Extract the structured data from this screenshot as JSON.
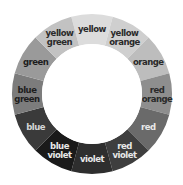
{
  "diagram": {
    "title": "",
    "type": "color-wheel",
    "center": [
      92,
      94
    ],
    "outer_radius": 80,
    "inner_radius": 50,
    "segments": [
      {
        "name": "yellow",
        "lines": [
          "yellow"
        ],
        "fill": "#dcdcdc",
        "text_color": "#2a2a2a"
      },
      {
        "name": "yellow orange",
        "lines": [
          "yellow",
          "orange"
        ],
        "fill": "#cfcfcf",
        "text_color": "#2a2a2a"
      },
      {
        "name": "orange",
        "lines": [
          "orange"
        ],
        "fill": "#bdbdbd",
        "text_color": "#2a2a2a"
      },
      {
        "name": "red orange",
        "lines": [
          "red",
          "orange"
        ],
        "fill": "#8e8e8e",
        "text_color": "#2a2a2a"
      },
      {
        "name": "red",
        "lines": [
          "red"
        ],
        "fill": "#6a6a6a",
        "text_color": "#e8e8e8"
      },
      {
        "name": "red violet",
        "lines": [
          "red",
          "violet"
        ],
        "fill": "#3e3e3e",
        "text_color": "#e8e8e8"
      },
      {
        "name": "violet",
        "lines": [
          "violet"
        ],
        "fill": "#2e2e2e",
        "text_color": "#e8e8e8"
      },
      {
        "name": "blue violet",
        "lines": [
          "blue",
          "violet"
        ],
        "fill": "#1a1a1a",
        "text_color": "#e8e8e8"
      },
      {
        "name": "blue",
        "lines": [
          "blue"
        ],
        "fill": "#3a3a3a",
        "text_color": "#d6d6d6"
      },
      {
        "name": "blue green",
        "lines": [
          "blue",
          "green"
        ],
        "fill": "#7c7c7c",
        "text_color": "#1e1e1e"
      },
      {
        "name": "green",
        "lines": [
          "green"
        ],
        "fill": "#9a9a9a",
        "text_color": "#1e1e1e"
      },
      {
        "name": "yellow green",
        "lines": [
          "yellow",
          "green"
        ],
        "fill": "#c2c2c2",
        "text_color": "#2a2a2a"
      }
    ]
  }
}
